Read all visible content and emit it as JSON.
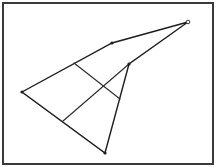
{
  "diagram": {
    "type": "geometric-figure",
    "frame": {
      "x": 3,
      "y": 3,
      "width": 210,
      "height": 161
    },
    "vertices": [
      {
        "id": "tip",
        "x": 188,
        "y": 22,
        "marker": "open"
      },
      {
        "id": "top-mid",
        "x": 112,
        "y": 43,
        "marker": "filled"
      },
      {
        "id": "left",
        "x": 22,
        "y": 92,
        "marker": "filled"
      },
      {
        "id": "bottom",
        "x": 105,
        "y": 153,
        "marker": "filled"
      },
      {
        "id": "inner",
        "x": 129,
        "y": 64,
        "marker": "filled"
      }
    ],
    "outline_path": [
      "tip",
      "top-mid",
      "left",
      "bottom",
      "inner",
      "tip"
    ],
    "inner_segments": [
      {
        "from": {
          "x": 74,
          "y": 63
        },
        "to": {
          "x": 120,
          "y": 99
        }
      },
      {
        "from": {
          "x": 129,
          "y": 64
        },
        "to": {
          "x": 63,
          "y": 121
        }
      }
    ],
    "colors": {
      "stroke": "#1e1e1e",
      "frame": "#3a3a3a",
      "background": "#ffffff"
    }
  }
}
